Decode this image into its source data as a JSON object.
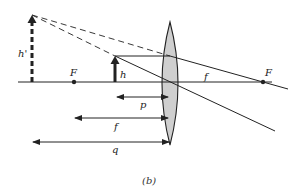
{
  "figure": {
    "caption": "(b)",
    "type": "converging-lens-virtual-image",
    "colors": {
      "ink": "#222222",
      "lens_fill": "#cfcfcf",
      "background": "#ffffff"
    }
  },
  "labels": {
    "image_height": "h'",
    "object_height": "h",
    "focal_point_left": "F",
    "focal_point_right": "F",
    "focal_length_right": "f",
    "object_distance": "p",
    "focal_length_lower": "f",
    "image_distance": "q"
  },
  "geometry": {
    "axis_y": 82,
    "lens_x": 170,
    "lens_top": 22,
    "lens_bottom": 145,
    "object": {
      "x": 115,
      "top": 56
    },
    "image": {
      "x": 32,
      "top": 15
    },
    "focal_left_x": 74,
    "focal_right_x": 263
  }
}
